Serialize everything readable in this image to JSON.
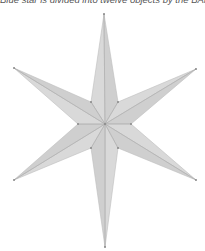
{
  "caption": "Blue star is divided into twelve objects by the BANet",
  "figure": {
    "shape": "six-pointed star",
    "segments": 12,
    "center": [
      105,
      124
    ],
    "outer_tips": [
      [
        104,
        14
      ],
      [
        196,
        69
      ],
      [
        196,
        180
      ],
      [
        105,
        247
      ],
      [
        14,
        180
      ],
      [
        14,
        68
      ]
    ],
    "inner_notches": [
      [
        118,
        102
      ],
      [
        131,
        124
      ],
      [
        118,
        148
      ],
      [
        91,
        148
      ],
      [
        78,
        124
      ],
      [
        91,
        102
      ]
    ],
    "colors": {
      "fill": "#d9d9d9",
      "fill_alt": "#cfcfcf",
      "edge": "#bdbdbd",
      "inner_line": "#a8a8a8",
      "point": "#888888"
    }
  }
}
